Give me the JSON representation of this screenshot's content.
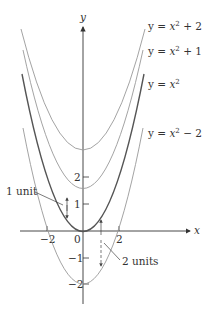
{
  "figure": {
    "axes": {
      "x_label": "x",
      "y_label": "y",
      "x_ticks": [
        {
          "value": -2,
          "label": "−2"
        },
        {
          "value": 0,
          "label": "0"
        },
        {
          "value": 2,
          "label": "2"
        }
      ],
      "y_ticks": [
        {
          "value": 2,
          "label": "2"
        },
        {
          "value": 1,
          "label": "1"
        },
        {
          "value": -1,
          "label": "−1"
        },
        {
          "value": -2,
          "label": "−2"
        }
      ]
    },
    "curves": [
      {
        "equation": "y = x² + 2",
        "label_prefix": "y = ",
        "label_var": "x",
        "label_exp": "2",
        "label_suffix": " + 2",
        "shift": 2
      },
      {
        "equation": "y = x² + 1",
        "label_prefix": "y = ",
        "label_var": "x",
        "label_exp": "2",
        "label_suffix": " + 1",
        "shift": 1
      },
      {
        "equation": "y = x²",
        "label_prefix": "y = ",
        "label_var": "x",
        "label_exp": "2",
        "label_suffix": "",
        "shift": 0
      },
      {
        "equation": "y = x² − 2",
        "label_prefix": "y = ",
        "label_var": "x",
        "label_exp": "2",
        "label_suffix": " − 2",
        "shift": -2
      }
    ],
    "annotations": [
      {
        "text": "1 unit"
      },
      {
        "text": "2 units"
      }
    ],
    "colors": {
      "axis": "#333333",
      "base_curve": "#555555",
      "shifted_curves": "#999999",
      "text": "#333333"
    }
  }
}
